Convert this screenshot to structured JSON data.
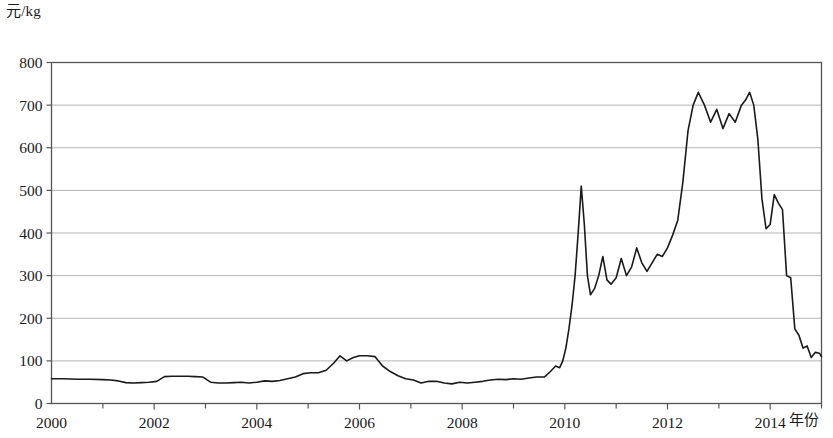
{
  "axes": {
    "y_unit_label": "元/kg",
    "x_name_label": "年份"
  },
  "chart_data": {
    "type": "line",
    "title": "",
    "subtitle": "",
    "xlabel": "年份",
    "ylabel": "元/kg",
    "grid": true,
    "legend": "none",
    "xlim": [
      2000,
      2015
    ],
    "ylim": [
      0,
      800
    ],
    "yticks": [
      0,
      100,
      200,
      300,
      400,
      500,
      600,
      700,
      800
    ],
    "ytick_labels": [
      "0",
      "100",
      "200",
      "300",
      "400",
      "500",
      "600",
      "700",
      "800"
    ],
    "xticks": [
      2000,
      2001,
      2002,
      2003,
      2004,
      2005,
      2006,
      2007,
      2008,
      2009,
      2010,
      2011,
      2012,
      2013,
      2014,
      2015
    ],
    "xtick_labels_major": [
      "2000",
      "2002",
      "2004",
      "2006",
      "2008",
      "2010",
      "2012",
      "2014"
    ],
    "xticks_major": [
      2000,
      2002,
      2004,
      2006,
      2008,
      2010,
      2012,
      2014
    ],
    "line_color": "#1a1a1a",
    "line_width": 1.6,
    "grid_color": "#b4b4b4",
    "axis_color": "#555555",
    "series": [
      {
        "name": "价格",
        "x": [
          2000.0,
          2000.25,
          2000.5,
          2000.75,
          2001.0,
          2001.15,
          2001.3,
          2001.45,
          2001.6,
          2001.75,
          2001.9,
          2002.05,
          2002.2,
          2002.35,
          2002.5,
          2002.65,
          2002.8,
          2002.95,
          2003.1,
          2003.25,
          2003.4,
          2003.55,
          2003.7,
          2003.85,
          2004.0,
          2004.15,
          2004.3,
          2004.45,
          2004.6,
          2004.75,
          2004.9,
          2005.05,
          2005.2,
          2005.35,
          2005.5,
          2005.62,
          2005.75,
          2005.88,
          2006.0,
          2006.15,
          2006.3,
          2006.45,
          2006.6,
          2006.75,
          2006.9,
          2007.05,
          2007.2,
          2007.35,
          2007.5,
          2007.65,
          2007.8,
          2007.95,
          2008.1,
          2008.25,
          2008.4,
          2008.55,
          2008.7,
          2008.85,
          2009.0,
          2009.15,
          2009.3,
          2009.45,
          2009.6,
          2009.72,
          2009.82,
          2009.9,
          2009.96,
          2010.02,
          2010.08,
          2010.14,
          2010.2,
          2010.26,
          2010.32,
          2010.38,
          2010.44,
          2010.5,
          2010.58,
          2010.66,
          2010.74,
          2010.82,
          2010.9,
          2011.0,
          2011.1,
          2011.2,
          2011.3,
          2011.4,
          2011.5,
          2011.6,
          2011.7,
          2011.8,
          2011.9,
          2012.0,
          2012.1,
          2012.2,
          2012.3,
          2012.4,
          2012.5,
          2012.6,
          2012.72,
          2012.84,
          2012.96,
          2013.08,
          2013.2,
          2013.32,
          2013.44,
          2013.52,
          2013.6,
          2013.68,
          2013.76,
          2013.84,
          2013.92,
          2014.0,
          2014.08,
          2014.16,
          2014.24,
          2014.32,
          2014.4,
          2014.48,
          2014.56,
          2014.64,
          2014.72,
          2014.8,
          2014.88,
          2014.96,
          2015.0
        ],
        "values": [
          58,
          58,
          57,
          57,
          56,
          55,
          53,
          49,
          48,
          49,
          50,
          52,
          63,
          64,
          64,
          64,
          63,
          62,
          50,
          48,
          48,
          49,
          50,
          48,
          50,
          53,
          52,
          54,
          58,
          62,
          70,
          72,
          72,
          78,
          95,
          112,
          100,
          108,
          112,
          112,
          110,
          88,
          75,
          65,
          58,
          55,
          48,
          52,
          52,
          48,
          46,
          50,
          48,
          50,
          52,
          55,
          57,
          56,
          58,
          57,
          60,
          62,
          62,
          75,
          88,
          84,
          100,
          130,
          175,
          230,
          300,
          400,
          510,
          420,
          300,
          255,
          270,
          300,
          345,
          290,
          280,
          295,
          340,
          300,
          320,
          365,
          330,
          310,
          330,
          350,
          345,
          365,
          395,
          430,
          520,
          640,
          700,
          730,
          700,
          660,
          690,
          645,
          680,
          660,
          700,
          712,
          730,
          700,
          620,
          480,
          410,
          420,
          490,
          470,
          455,
          300,
          295,
          175,
          160,
          130,
          135,
          108,
          120,
          118,
          110
        ]
      }
    ],
    "notable_points": [
      {
        "label": "2010 spike peak",
        "x": 2010.32,
        "y": 510
      },
      {
        "label": "2012 plateau peak",
        "x": 2012.6,
        "y": 730
      },
      {
        "label": "2013 second peak",
        "x": 2013.6,
        "y": 730
      },
      {
        "label": "2005 local peak",
        "x": 2005.62,
        "y": 112
      },
      {
        "label": "final value",
        "x": 2015.0,
        "y": 110
      }
    ]
  }
}
